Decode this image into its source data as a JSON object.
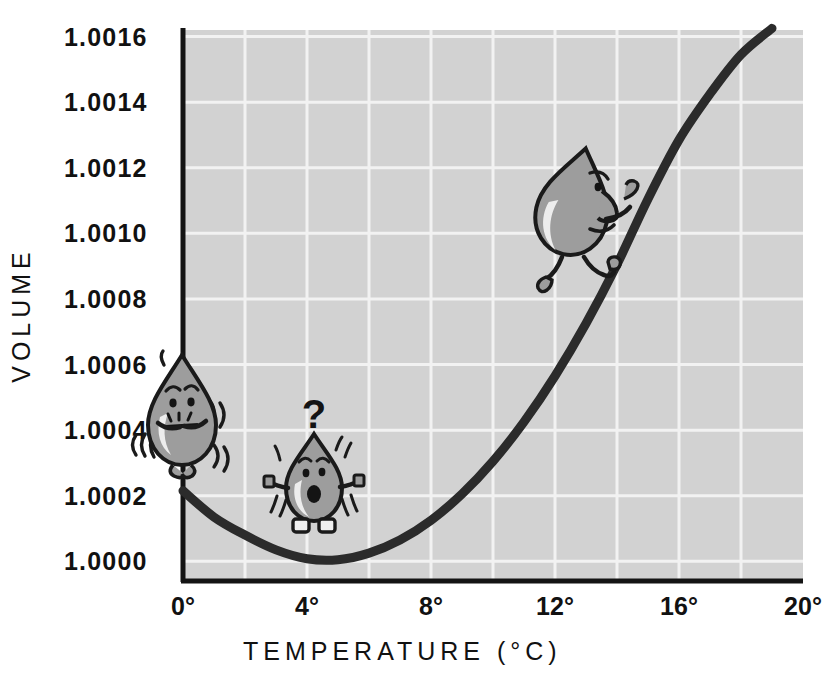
{
  "figure": {
    "background_color": "#ffffff",
    "plot_background_color": "#d2d2d2",
    "gridline_color": "#f2f2f2",
    "axis_color": "#141414",
    "curve_color": "#2b2b2b",
    "droplet_fill": "#9d9d9d",
    "droplet_highlight": "#e8e8e8",
    "droplet_outline": "#1a1a1a"
  },
  "chart_data": {
    "type": "line",
    "title": "",
    "subtitle": "",
    "xlabel": "TEMPERATURE (°C)",
    "ylabel": "VOLUME",
    "xlim": [
      0,
      20
    ],
    "ylim": [
      0.99994,
      1.00162
    ],
    "grid": true,
    "legend": "none",
    "x_tick_labels": [
      "0°",
      "4°",
      "8°",
      "12°",
      "16°",
      "20°"
    ],
    "x_tick_values": [
      0,
      4,
      8,
      12,
      16,
      20
    ],
    "x_gridline_values": [
      2,
      4,
      6,
      8,
      10,
      12,
      14,
      16,
      18
    ],
    "y_tick_labels": [
      "1.0016",
      "1.0014",
      "1.0012",
      "1.0010",
      "1.0008",
      "1.0006",
      "1.0004",
      "1.0002",
      "1.0000"
    ],
    "y_tick_values": [
      1.0016,
      1.0014,
      1.0012,
      1.001,
      1.0008,
      1.0006,
      1.0004,
      1.0002,
      1.0
    ],
    "series": [
      {
        "name": "Specific volume of water",
        "x": [
          0,
          1,
          2,
          3,
          4,
          5,
          6,
          7,
          8,
          9,
          10,
          11,
          12,
          13,
          14,
          15,
          16,
          17,
          18,
          19
        ],
        "y": [
          1.000215,
          1.000135,
          1.00008,
          1.000035,
          1.000008,
          1.000005,
          1.000025,
          1.000065,
          1.000125,
          1.000205,
          1.000305,
          1.000425,
          1.000565,
          1.000725,
          1.000905,
          1.001105,
          1.001285,
          1.001425,
          1.001545,
          1.001625
        ]
      }
    ],
    "annotations": [
      {
        "name": "shivering-droplet",
        "label": "shivering water droplet at 0°C",
        "x": 0.1,
        "y": 1.00033,
        "state": "cold-shivering"
      },
      {
        "name": "confused-droplet",
        "label": "confused water droplet at minimum volume",
        "x": 3.9,
        "y": 1.000085,
        "state": "puzzled",
        "thought": "?"
      },
      {
        "name": "climbing-droplet",
        "label": "happy water droplet climbing the rising curve",
        "x": 12.3,
        "y": 1.00098,
        "state": "climbing"
      }
    ]
  },
  "axis_titles": {
    "x": "TEMPERATURE (°C)",
    "y": "VOLUME"
  },
  "thought_bubble": {
    "question_mark": "?"
  }
}
